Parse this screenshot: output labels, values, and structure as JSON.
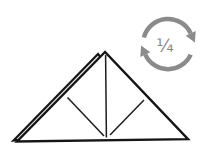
{
  "diagram": {
    "type": "origami-fold-step",
    "shape": {
      "name": "folded-triangle",
      "outline_color": "#161616",
      "crease_color": "#1d1d1d",
      "fill": "#ffffff",
      "back_layer_fill": "#ebebeb"
    },
    "rotation_symbol": {
      "label": "¼",
      "direction": "clockwise",
      "color": "#8b8b8b"
    }
  }
}
